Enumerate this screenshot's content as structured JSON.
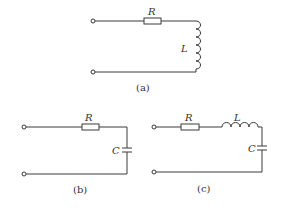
{
  "figure": {
    "circuits": [
      {
        "id": "a",
        "caption": "(a)",
        "components": [
          {
            "type": "resistor",
            "label": "R"
          },
          {
            "type": "inductor",
            "label": "L"
          }
        ]
      },
      {
        "id": "b",
        "caption": "(b)",
        "components": [
          {
            "type": "resistor",
            "label": "R"
          },
          {
            "type": "capacitor",
            "label": "C"
          }
        ]
      },
      {
        "id": "c",
        "caption": "(c)",
        "components": [
          {
            "type": "resistor",
            "label": "R"
          },
          {
            "type": "inductor",
            "label": "L"
          },
          {
            "type": "capacitor",
            "label": "C"
          }
        ]
      }
    ]
  },
  "colors": {
    "line": "#3a3a3a",
    "background": "#ffffff"
  }
}
